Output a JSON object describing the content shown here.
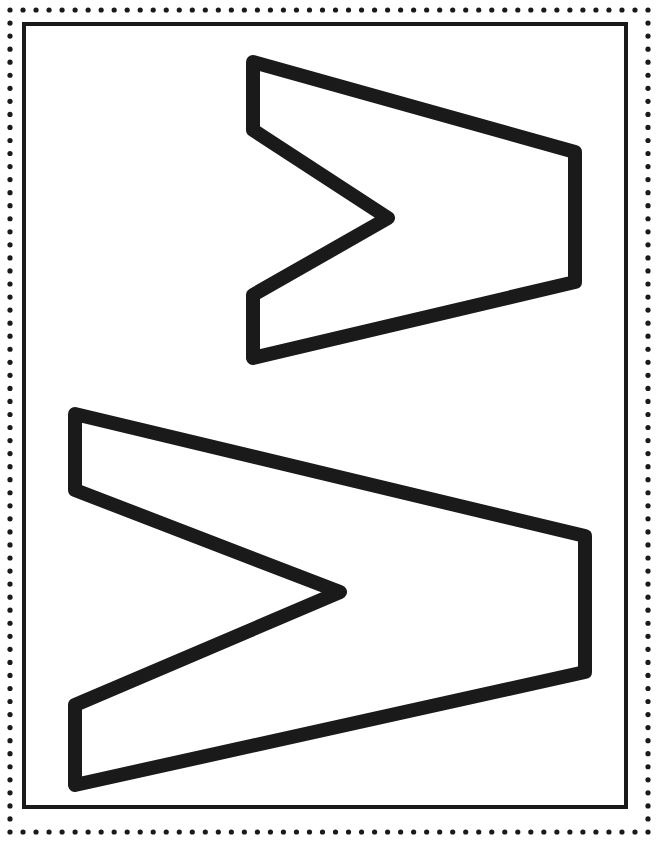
{
  "page": {
    "kind": "printable-letter-template",
    "width": 658,
    "height": 842,
    "background_color": "#ffffff",
    "ink_color": "#1a1a1a"
  },
  "frame": {
    "dotted_border": {
      "name": "dotted-border",
      "dot_color": "#1a1a1a",
      "dot_radius": 2.6,
      "dot_spacing": 13,
      "inset": 10
    },
    "inner_border": {
      "name": "inner-rectangle-border",
      "color": "#1a1a1a",
      "thickness": 4,
      "x": 22,
      "y": 22,
      "width": 606,
      "height": 787
    }
  },
  "letters": [
    {
      "name": "letter-w-top",
      "character": "W",
      "rotation_degrees": 90,
      "style": "outline",
      "stroke_color": "#1a1a1a",
      "stroke_width": 14,
      "fill": "none",
      "bounds": {
        "x": 240,
        "y": 56,
        "width": 342,
        "height": 308
      },
      "outline_points": "253,62 575,152 575,282 253,358 253,295 388,218 253,130"
    },
    {
      "name": "letter-w-bottom",
      "character": "W",
      "rotation_degrees": 90,
      "style": "outline",
      "stroke_color": "#1a1a1a",
      "stroke_width": 14,
      "fill": "none",
      "bounds": {
        "x": 61,
        "y": 408,
        "width": 531,
        "height": 384
      },
      "outline_points": "75,414 585,536 585,672 75,785 75,705 340,592 75,490"
    }
  ],
  "chart_data": {
    "type": "table",
    "title": "",
    "categories": [
      "letter-w-top",
      "letter-w-bottom"
    ],
    "values": [
      1,
      1
    ]
  }
}
